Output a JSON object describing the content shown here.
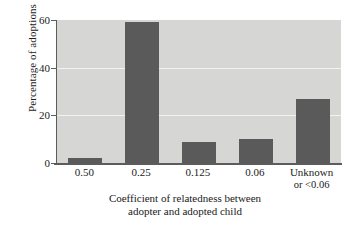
{
  "chart_data": {
    "type": "bar",
    "title": "",
    "subtitle": "",
    "xlabel_line1": "Coefficient of relatedness between",
    "xlabel_line2": "adopter and adopted child",
    "ylabel": "Percentage of adoptions",
    "categories": [
      "0.50",
      "0.25",
      "0.125",
      "0.06",
      "Unknown"
    ],
    "category_sublabels": [
      "",
      "",
      "",
      "",
      "or <0.06"
    ],
    "values": [
      2,
      59,
      9,
      10,
      27
    ],
    "ylim": [
      0,
      60
    ],
    "yticks": [
      0,
      20,
      40,
      60
    ],
    "ytick_labels": [
      "0",
      "20",
      "40",
      "60"
    ],
    "grid": true,
    "gridlines_at": [
      20,
      40
    ],
    "legend": "none",
    "bar_color": "#5a5a5a",
    "plot_background": "#d6d6d4",
    "figure_background": "#ffffff",
    "axis_color": "#5c5c5c",
    "gridline_color": "#f2f2f0"
  }
}
